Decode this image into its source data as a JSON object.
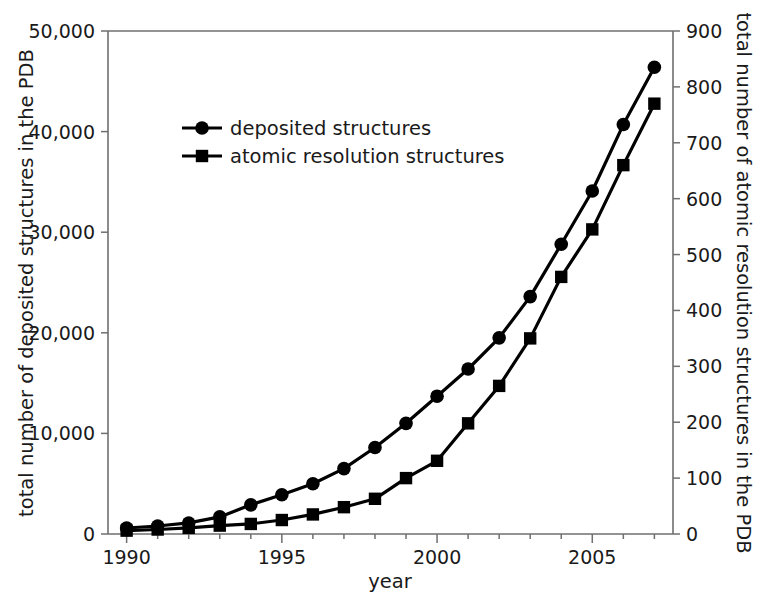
{
  "chart_data": {
    "type": "line",
    "title": "",
    "xlabel": "year",
    "ylabel": "total number of deposited structures in the PDB",
    "y2label": "total number of atomic resolution structures in the PDB",
    "x": [
      1990,
      1991,
      1992,
      1993,
      1994,
      1995,
      1996,
      1997,
      1998,
      1999,
      2000,
      2001,
      2002,
      2003,
      2004,
      2005,
      2006,
      2007
    ],
    "xlim": [
      1989.4,
      2007.6
    ],
    "xticks": [
      1990,
      1995,
      2000,
      2005
    ],
    "xticklabels": [
      "1990",
      "1995",
      "2000",
      "2005"
    ],
    "xminorticks": [
      1991,
      1992,
      1993,
      1994,
      1996,
      1997,
      1998,
      1999,
      2001,
      2002,
      2003,
      2004,
      2006,
      2007
    ],
    "ylim": [
      0,
      50000
    ],
    "yticks": [
      0,
      10000,
      20000,
      30000,
      40000,
      50000
    ],
    "yticklabels": [
      "0",
      "10,000",
      "20,000",
      "30,000",
      "40,000",
      "50,000"
    ],
    "y2lim": [
      0,
      900
    ],
    "y2ticks": [
      0,
      100,
      200,
      300,
      400,
      500,
      600,
      700,
      800,
      900
    ],
    "y2ticklabels": [
      "0",
      "100",
      "200",
      "300",
      "400",
      "500",
      "600",
      "700",
      "800",
      "900"
    ],
    "grid": false,
    "legend_position": "upper-left-inside",
    "series": [
      {
        "name": "deposited structures",
        "marker": "circle",
        "axis": "left",
        "color": "#000000",
        "values": [
          600,
          800,
          1100,
          1700,
          2900,
          3900,
          5000,
          6500,
          8600,
          11000,
          13700,
          16400,
          19500,
          23600,
          28800,
          34100,
          40700,
          46400
        ]
      },
      {
        "name": "atomic resolution structures",
        "marker": "square",
        "axis": "right",
        "color": "#000000",
        "values": [
          6,
          8,
          11,
          15,
          18,
          25,
          35,
          48,
          63,
          100,
          131,
          198,
          265,
          350,
          460,
          545,
          660,
          770
        ]
      }
    ]
  },
  "legend": {
    "items": [
      {
        "label": "deposited structures",
        "marker": "circle"
      },
      {
        "label": "atomic resolution structures",
        "marker": "square"
      }
    ]
  },
  "axes": {
    "left_title": "total number of deposited structures in the PDB",
    "right_title": "total number of atomic resolution structures in the PDB",
    "bottom_title": "year"
  }
}
